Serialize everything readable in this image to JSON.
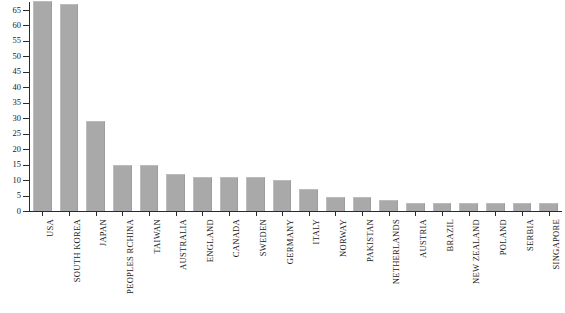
{
  "chart_data": {
    "type": "bar",
    "title": "",
    "subtitle": "",
    "xlabel": "",
    "ylabel": "",
    "ylim": [
      0,
      68
    ],
    "y_ticks": [
      0,
      5,
      10,
      15,
      20,
      25,
      30,
      35,
      40,
      45,
      50,
      55,
      60,
      65
    ],
    "grid": false,
    "legend": false,
    "legend_position": "none",
    "bar_color": "#a9a9a9",
    "axis_color": "#2b2b2b",
    "background_color": "#ffffff",
    "categories": [
      "USA",
      "SOUTH KOREA",
      "JAPAN",
      "PEOPLES RCHINA",
      "TAIWAN",
      "AUSTRALIA",
      "ENGLAND",
      "CANADA",
      "SWEDEN",
      "GERMANY",
      "ITALY",
      "NORWAY",
      "PAKISTAN",
      "NETHERLANDS",
      "AUSTRIA",
      "BRAZIL",
      "NEW ZEALAND",
      "POLAND",
      "SERBIA",
      "SINGAPORE"
    ],
    "values": [
      68,
      67,
      29,
      15,
      15,
      12,
      11,
      11,
      11,
      10,
      7,
      4.5,
      4.5,
      3.5,
      2.5,
      2.5,
      2.5,
      2.5,
      2.5,
      2.5
    ]
  }
}
